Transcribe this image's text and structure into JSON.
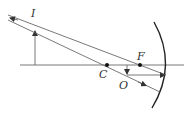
{
  "diagram": {
    "labels": {
      "image": "I",
      "focus": "F",
      "center": "C",
      "object": "O"
    },
    "colors": {
      "line": "#555555",
      "mirror": "#222222",
      "text": "#333333"
    }
  }
}
